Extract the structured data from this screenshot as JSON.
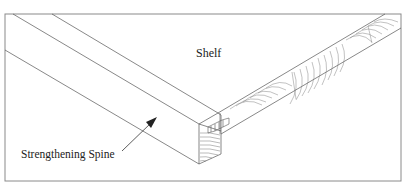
{
  "diagram": {
    "labels": {
      "shelf": "Shelf",
      "spine": "Strengthening Spine"
    },
    "colors": {
      "line": "#555555",
      "frame": "#777777",
      "text": "#222222",
      "background": "#ffffff"
    }
  }
}
